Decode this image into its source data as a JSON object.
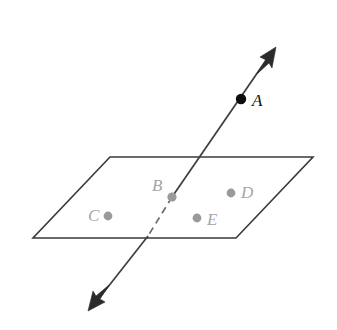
{
  "figure": {
    "canvas": {
      "width": 337,
      "height": 330
    },
    "background_color": "#ffffff"
  },
  "plane": {
    "name": "plane-parallelogram",
    "stroke_color": "#3a3a3a",
    "fill": "none",
    "vertices": [
      {
        "x": 110,
        "y": 157
      },
      {
        "x": 313,
        "y": 157
      },
      {
        "x": 236,
        "y": 238
      },
      {
        "x": 33,
        "y": 238
      }
    ],
    "points_string": "110,157 313,157 236,238 33,238"
  },
  "line": {
    "name": "double-headed-line",
    "stroke_color": "#3f3f3f",
    "hidden_stroke_color": "#6a6a6a",
    "upper_segment": {
      "x1": 271,
      "y1": 53,
      "x2": 172,
      "y2": 197
    },
    "hidden_segment": {
      "x1": 172,
      "y1": 197,
      "x2": 148,
      "y2": 236
    },
    "lower_segment": {
      "x1": 148,
      "y1": 236,
      "x2": 93,
      "y2": 306
    },
    "arrow_top": {
      "tip_x": 276,
      "tip_y": 47,
      "points_string": "276,47 260,57 266,60 257,74 269,63 272,68"
    },
    "arrow_bottom": {
      "tip_x": 88,
      "tip_y": 311,
      "points_string": "88,311 105,302 100,299 109,285 96,296 93,291"
    }
  },
  "points": [
    {
      "id": "A",
      "label": "A",
      "style": "solid-black",
      "dot_color": "#0d0d0d",
      "label_color": "#111111",
      "dot_x": 241,
      "dot_y": 99,
      "dot_r": 5.2,
      "label_x": 252,
      "label_y": 106,
      "label_anchor": "start"
    },
    {
      "id": "B",
      "label": "B",
      "style": "gray",
      "dot_color": "#9a9a9a",
      "label_color": "#a6a6a6",
      "dot_x": 172,
      "dot_y": 197,
      "dot_r": 4.6,
      "label_x": 152,
      "label_y": 191,
      "label_anchor": "start"
    },
    {
      "id": "C",
      "label": "C",
      "style": "gray",
      "dot_color": "#9a9a9a",
      "label_color": "#a6a6a6",
      "dot_x": 108,
      "dot_y": 216,
      "dot_r": 4.4,
      "label_x": 88,
      "label_y": 221,
      "label_anchor": "start"
    },
    {
      "id": "D",
      "label": "D",
      "style": "gray",
      "dot_color": "#9a9a9a",
      "label_color": "#a6a6a6",
      "dot_x": 231,
      "dot_y": 193,
      "dot_r": 4.4,
      "label_x": 241,
      "label_y": 198,
      "label_anchor": "start"
    },
    {
      "id": "E",
      "label": "E",
      "style": "gray",
      "dot_color": "#9a9a9a",
      "label_color": "#a6a6a6",
      "dot_x": 197,
      "dot_y": 218,
      "dot_r": 4.4,
      "label_x": 207,
      "label_y": 225,
      "label_anchor": "start"
    }
  ]
}
